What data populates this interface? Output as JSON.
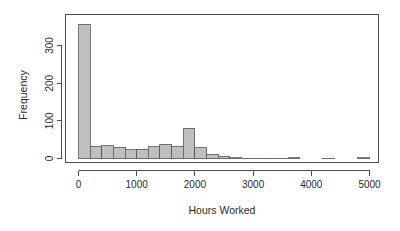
{
  "chart_data": {
    "type": "bar",
    "title": "",
    "subtitle": "",
    "xlabel": "Hours Worked",
    "ylabel": "Frequency",
    "xlim": [
      -100,
      5200
    ],
    "ylim": [
      0,
      370
    ],
    "bin_width": 200,
    "grid": false,
    "legend": null,
    "xticks": [
      0,
      1000,
      2000,
      3000,
      4000,
      5000
    ],
    "xtick_labels": [
      "0",
      "1000",
      "2000",
      "3000",
      "4000",
      "5000"
    ],
    "yticks": [
      0,
      100,
      200,
      300
    ],
    "ytick_labels": [
      "0",
      "100",
      "200",
      "300"
    ],
    "bin_edges": [
      0,
      200,
      400,
      600,
      800,
      1000,
      1200,
      1400,
      1600,
      1800,
      2000,
      2200,
      2400,
      2600,
      2800,
      3000,
      3200,
      3400,
      3600,
      3800,
      4000,
      4200,
      4400,
      4600,
      4800,
      5000
    ],
    "categories": [
      "0-200",
      "200-400",
      "400-600",
      "600-800",
      "800-1000",
      "1000-1200",
      "1200-1400",
      "1400-1600",
      "1600-1800",
      "1800-2000",
      "2000-2200",
      "2200-2400",
      "2400-2600",
      "2600-2800",
      "2800-3000",
      "3000-3200",
      "3200-3400",
      "3400-3600",
      "3600-3800",
      "3800-4000",
      "4000-4200",
      "4200-4400",
      "4400-4600",
      "4600-4800",
      "4800-5000"
    ],
    "values": [
      357,
      32,
      34,
      30,
      23,
      25,
      31,
      38,
      33,
      80,
      28,
      11,
      6,
      2,
      1,
      1,
      1,
      1,
      2,
      0,
      0,
      1,
      0,
      0,
      2
    ],
    "bar_fill_color": "#bfbfbf",
    "bar_border_color": "#5a5a5a",
    "axis_color": "#4d4d4d",
    "background_color": "#ffffff"
  },
  "labels": {
    "ylabel": "Frequency",
    "xlabel": "Hours Worked"
  }
}
